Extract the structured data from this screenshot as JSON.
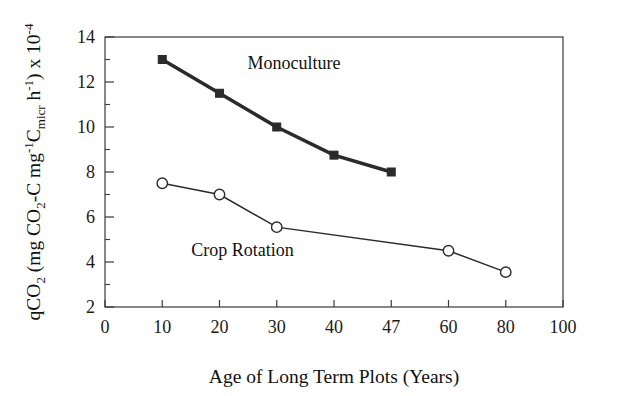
{
  "chart_data": {
    "type": "line",
    "title": "",
    "xlabel": "Age of Long Term Plots (Years)",
    "ylabel": "qCO2 (mg CO2-C mg-1Cmicr h-1) x 10-4",
    "ylabel_parts": {
      "p1": "qCO",
      "p1_sub": "2",
      "p2": " (mg CO",
      "p2_sub": "2",
      "p3": "-C mg",
      "p3_sup": "-1",
      "p4": "C",
      "p4_sub": "micr",
      "p5": " h",
      "p5_sup": "-1",
      "p6": ") x 10",
      "p6_sup": "-4"
    },
    "xlim": [
      0,
      100
    ],
    "ylim": [
      2,
      14
    ],
    "grid": false,
    "legend_position": "inline-annotations",
    "xticks": [
      {
        "value": 0,
        "label": "0"
      },
      {
        "value": 10,
        "label": "10"
      },
      {
        "value": 20,
        "label": "20"
      },
      {
        "value": 30,
        "label": "30"
      },
      {
        "value": 40,
        "label": "40"
      },
      {
        "value": 47,
        "label": "47"
      },
      {
        "value": 60,
        "label": "60"
      },
      {
        "value": 80,
        "label": "80"
      },
      {
        "value": 100,
        "label": "100"
      }
    ],
    "yticks": [
      {
        "value": 2,
        "label": "2"
      },
      {
        "value": 4,
        "label": "4"
      },
      {
        "value": 6,
        "label": "6"
      },
      {
        "value": 8,
        "label": "8"
      },
      {
        "value": 10,
        "label": "10"
      },
      {
        "value": 12,
        "label": "12"
      },
      {
        "value": 14,
        "label": "14"
      }
    ],
    "y_minor_ticks": [
      3,
      5,
      7,
      9,
      11,
      13
    ],
    "series": [
      {
        "name": "Monoculture",
        "marker": "filled-square",
        "line_width": "thick",
        "x": [
          10,
          20,
          30,
          40,
          47
        ],
        "values": [
          13.0,
          11.5,
          10.0,
          8.75,
          8.0
        ],
        "annotation": "Monoculture",
        "annotation_x": 33,
        "annotation_y": 12.6
      },
      {
        "name": "Crop Rotation",
        "marker": "open-circle",
        "line_width": "thin",
        "x": [
          10,
          20,
          30,
          60,
          80
        ],
        "values": [
          7.5,
          7.0,
          5.55,
          4.5,
          3.55
        ],
        "annotation": "Crop Rotation",
        "annotation_x": 24,
        "annotation_y": 4.25
      }
    ],
    "colors": {
      "axis": "#3a3a3a",
      "monoculture": "#2b2b2b",
      "crop_rotation": "#2b2b2b",
      "background": "#ffffff"
    }
  }
}
